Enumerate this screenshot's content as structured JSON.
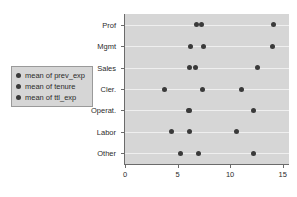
{
  "chart_data": {
    "type": "scatter",
    "title": "",
    "xlabel": "",
    "ylabel": "",
    "xlim": [
      0,
      15.6
    ],
    "ylim": [
      0,
      7
    ],
    "grid": true,
    "legend_position": "left-outside",
    "categories": [
      "Prof",
      "Mgmt",
      "Sales",
      "Cler.",
      "Operat.",
      "Labor",
      "Other"
    ],
    "xticks": [
      "0",
      "5",
      "10",
      "15"
    ],
    "xtick_values": [
      0,
      5,
      10,
      15
    ],
    "marker_color": "#3a3a3a",
    "plot_bg_color": "#d6d6d6",
    "gridline_color": "#efefef",
    "axis_color": "#6b6b6b",
    "legend": [
      {
        "label": "mean of prev_exp",
        "marker": "circle",
        "color": "#3a3a3a"
      },
      {
        "label": "mean of tenure",
        "marker": "circle",
        "color": "#3a3a3a"
      },
      {
        "label": "mean of ttl_exp",
        "marker": "circle",
        "color": "#3a3a3a"
      }
    ],
    "series": [
      {
        "name": "mean of prev_exp",
        "values": [
          6.8,
          6.2,
          6.1,
          3.8,
          6.0,
          4.4,
          5.3
        ]
      },
      {
        "name": "mean of tenure",
        "values": [
          7.3,
          7.5,
          6.7,
          7.4,
          6.1,
          6.1,
          7.0
        ]
      },
      {
        "name": "mean of ttl_exp",
        "values": [
          14.1,
          14.0,
          12.6,
          11.1,
          12.2,
          10.6,
          12.2
        ]
      }
    ],
    "points": [
      {
        "category": "Prof",
        "series": "mean of prev_exp",
        "value": 6.8
      },
      {
        "category": "Prof",
        "series": "mean of tenure",
        "value": 7.3
      },
      {
        "category": "Prof",
        "series": "mean of ttl_exp",
        "value": 14.1
      },
      {
        "category": "Mgmt",
        "series": "mean of prev_exp",
        "value": 6.2
      },
      {
        "category": "Mgmt",
        "series": "mean of tenure",
        "value": 7.5
      },
      {
        "category": "Mgmt",
        "series": "mean of ttl_exp",
        "value": 14.0
      },
      {
        "category": "Sales",
        "series": "mean of prev_exp",
        "value": 6.1
      },
      {
        "category": "Sales",
        "series": "mean of tenure",
        "value": 6.7
      },
      {
        "category": "Sales",
        "series": "mean of ttl_exp",
        "value": 12.6
      },
      {
        "category": "Cler.",
        "series": "mean of prev_exp",
        "value": 3.8
      },
      {
        "category": "Cler.",
        "series": "mean of tenure",
        "value": 7.4
      },
      {
        "category": "Cler.",
        "series": "mean of ttl_exp",
        "value": 11.1
      },
      {
        "category": "Operat.",
        "series": "mean of prev_exp",
        "value": 6.0
      },
      {
        "category": "Operat.",
        "series": "mean of tenure",
        "value": 6.1
      },
      {
        "category": "Operat.",
        "series": "mean of ttl_exp",
        "value": 12.2
      },
      {
        "category": "Labor",
        "series": "mean of prev_exp",
        "value": 4.4
      },
      {
        "category": "Labor",
        "series": "mean of tenure",
        "value": 6.1
      },
      {
        "category": "Labor",
        "series": "mean of ttl_exp",
        "value": 10.6
      },
      {
        "category": "Other",
        "series": "mean of prev_exp",
        "value": 5.3
      },
      {
        "category": "Other",
        "series": "mean of tenure",
        "value": 7.0
      },
      {
        "category": "Other",
        "series": "mean of ttl_exp",
        "value": 12.2
      }
    ]
  }
}
